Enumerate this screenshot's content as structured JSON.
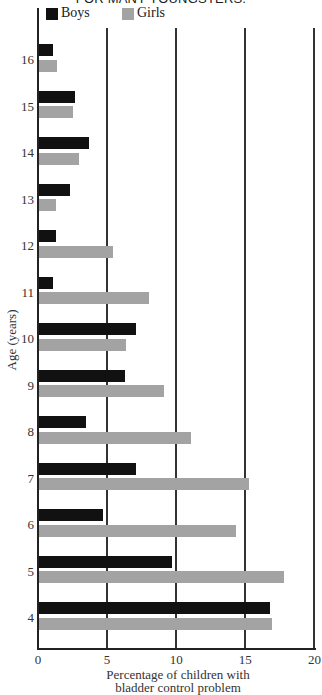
{
  "title": "FOR MANY YOUNGSTERS.",
  "colors": {
    "boys": "#111111",
    "girls": "#a3a3a3"
  },
  "chart_data": {
    "type": "bar",
    "orientation": "horizontal",
    "title": "FOR MANY YOUNGSTERS.",
    "xlabel": "Percentage of children with bladder control problem",
    "xlabel_lines": [
      "Percentage of children with",
      "bladder control problem"
    ],
    "ylabel": "Age (years)",
    "categories": [
      "16",
      "15",
      "14",
      "13",
      "12",
      "11",
      "10",
      "9",
      "8",
      "7",
      "6",
      "5",
      "4"
    ],
    "series": [
      {
        "name": "Boys",
        "color": "#111111",
        "values": [
          1.1,
          2.7,
          3.7,
          2.3,
          1.3,
          1.1,
          7.1,
          6.3,
          3.5,
          7.1,
          4.7,
          9.7,
          16.8
        ]
      },
      {
        "name": "Girls",
        "color": "#a3a3a3",
        "values": [
          1.4,
          2.5,
          3.0,
          1.3,
          5.4,
          8.0,
          6.4,
          9.1,
          11.1,
          15.3,
          14.3,
          17.8,
          16.9
        ]
      }
    ],
    "xlim": [
      0,
      20
    ],
    "xticks": [
      "0",
      "5",
      "10",
      "15",
      "20"
    ],
    "grid": "vertical lines at 5, 10, 15, 20",
    "legend": {
      "position": "top-left",
      "entries": [
        "Boys",
        "Girls"
      ]
    }
  }
}
